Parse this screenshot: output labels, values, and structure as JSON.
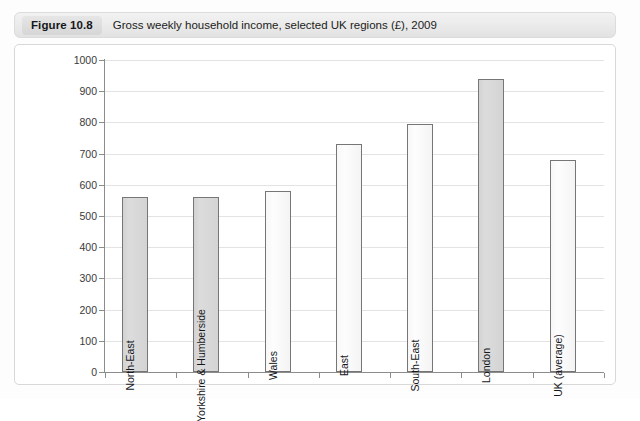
{
  "caption": {
    "figure_label": "Figure 10.8",
    "title": "Gross weekly household income, selected UK regions (£), 2009"
  },
  "chart_data": {
    "type": "bar",
    "title": "Gross weekly household income, selected UK regions (£), 2009",
    "xlabel": "",
    "ylabel": "",
    "ylim": [
      0,
      1000
    ],
    "ytick_step": 100,
    "yticks": [
      "1000",
      "900",
      "800",
      "700",
      "600",
      "500",
      "400",
      "300",
      "200",
      "100",
      "0"
    ],
    "grid": true,
    "legend": "none",
    "categories": [
      "North-East",
      "Yorkshire & Humberside",
      "Wales",
      "East",
      "South-East",
      "London",
      "UK (average)"
    ],
    "values": [
      560,
      560,
      580,
      730,
      795,
      940,
      680
    ],
    "bar_styles": [
      "shaded",
      "shaded",
      "plain",
      "plain",
      "plain",
      "shaded",
      "plain"
    ],
    "colors": {
      "shaded_fill": "#d6d6d6",
      "plain_fill": "#f8f8f8",
      "bar_border": "#767676",
      "gridline": "#e3e3e3",
      "axis": "#8c8c8c",
      "text": "#17181c"
    }
  }
}
